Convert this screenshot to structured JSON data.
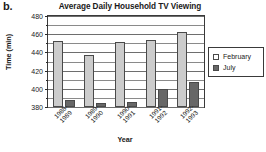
{
  "part_label": "b.",
  "chart_data": {
    "type": "bar",
    "title": "Average Daily Household TV Viewing",
    "xlabel": "Year",
    "ylabel": "Time (min)",
    "ylim": [
      380,
      480
    ],
    "ytick_step": 20,
    "yminor_step": 10,
    "grid": true,
    "legend_position": "right",
    "categories": [
      "1988-1989",
      "1989-1990",
      "1990-1991",
      "1991-1992",
      "1992-1993"
    ],
    "category_lines": [
      [
        "1988-",
        "1989"
      ],
      [
        "1989-",
        "1990"
      ],
      [
        "1990-",
        "1991"
      ],
      [
        "1991-",
        "1992"
      ],
      [
        "1992-",
        "1993"
      ]
    ],
    "yticks": [
      380,
      400,
      420,
      440,
      460,
      480
    ],
    "series": [
      {
        "name": "February",
        "color": "#cccccc",
        "values": [
          453,
          437,
          451,
          454,
          462
        ]
      },
      {
        "name": "July",
        "color": "#676767",
        "values": [
          388,
          384,
          386,
          400,
          408
        ]
      }
    ]
  },
  "legend": {
    "items": [
      {
        "label": "February"
      },
      {
        "label": "July"
      }
    ]
  }
}
